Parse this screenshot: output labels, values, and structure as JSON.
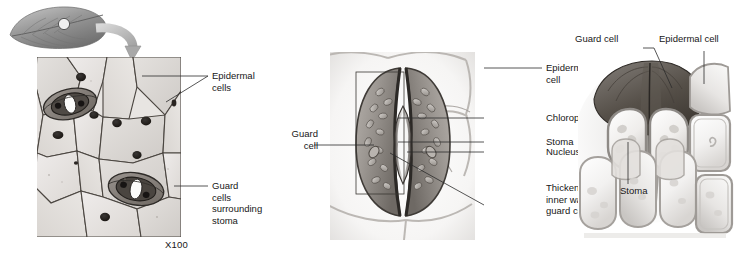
{
  "figure": {
    "background_color": "#ffffff",
    "text_color": "#171717"
  },
  "leaf_inset": {
    "name": "leaf-with-magnified-spot",
    "description": "Shaded leaf drawing with small circle marking the sampled area and a curved arrow pointing to the micrograph"
  },
  "panels": [
    {
      "id": "micrograph",
      "type": "light-micrograph",
      "magnification": "X100",
      "labels": [
        {
          "text": "Epidermal\ncells",
          "anchor": "right"
        },
        {
          "text": "Guard\ncells\nsurrounding\nstoma",
          "anchor": "right"
        }
      ]
    },
    {
      "id": "surface-view-drawing",
      "type": "surface-view-illustration",
      "labels": [
        {
          "text": "Epidermal\ncell",
          "anchor": "right"
        },
        {
          "text": "Chloroplast",
          "anchor": "right"
        },
        {
          "text": "Stoma",
          "anchor": "right"
        },
        {
          "text": "Nucleus",
          "anchor": "right"
        },
        {
          "text": "Thickened\ninner wall of\nguard cell",
          "anchor": "right"
        },
        {
          "text": "Guard\ncell",
          "anchor": "left"
        }
      ]
    },
    {
      "id": "cross-section-drawing",
      "type": "cross-section-illustration",
      "labels": [
        {
          "text": "Guard cell",
          "anchor": "top"
        },
        {
          "text": "Epidermal cell",
          "anchor": "top"
        },
        {
          "text": "Stoma",
          "anchor": "bottom"
        }
      ]
    }
  ],
  "labels_flat": {
    "epidermal_cells": "Epidermal\ncells",
    "guard_cells_surrounding_stoma": "Guard\ncells\nsurrounding\nstoma",
    "magnification": "X100",
    "epidermal_cell": "Epidermal\ncell",
    "chloroplast": "Chloroplast",
    "stoma": "Stoma",
    "nucleus": "Nucleus",
    "thickened_inner_wall": "Thickened\ninner wall of\nguard cell",
    "guard_cell_two_line": "Guard\ncell",
    "guard_cell": "Guard cell",
    "epidermal_cell_one_line": "Epidermal cell",
    "stoma_right": "Stoma"
  }
}
